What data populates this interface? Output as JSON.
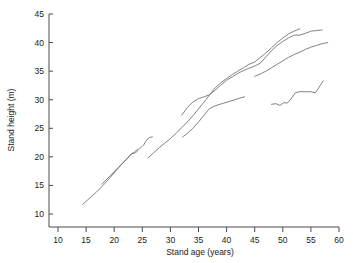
{
  "chart_data": {
    "type": "line",
    "title": "",
    "xlabel": "Stand age (years)",
    "ylabel": "Stand height (m)",
    "xlim": [
      7,
      60
    ],
    "ylim": [
      7.5,
      45
    ],
    "xticks": [
      10,
      15,
      20,
      25,
      30,
      35,
      40,
      45,
      50,
      55,
      60
    ],
    "yticks": [
      10,
      15,
      20,
      25,
      30,
      35,
      40,
      45
    ],
    "xtick_labels": [
      "10",
      "15",
      "20",
      "25",
      "30",
      "35",
      "40",
      "45",
      "50",
      "55",
      "60"
    ],
    "ytick_labels": [
      "10",
      "15",
      "20",
      "25",
      "30",
      "35",
      "40",
      "45"
    ],
    "grid": false,
    "legend": null,
    "line_color": "#6b6b6b",
    "axis_color": "#4a4a4a",
    "series": [
      {
        "name": "stand-1",
        "x": [
          14.4,
          15.2,
          16.0,
          16.8,
          17.6,
          18.4,
          19.2,
          20.0,
          20.8,
          21.6,
          22.4,
          23.0,
          23.6,
          24.2
        ],
        "y": [
          11.7,
          12.4,
          13.1,
          13.8,
          14.6,
          15.4,
          16.3,
          17.2,
          18.1,
          19.0,
          19.8,
          20.5,
          20.8,
          21.4
        ]
      },
      {
        "name": "stand-2",
        "x": [
          17.8,
          18.6,
          19.4,
          20.2,
          21.0,
          21.8,
          22.6,
          23.2,
          23.8,
          24.4,
          25.0
        ],
        "y": [
          15.2,
          16.0,
          16.8,
          17.6,
          18.4,
          19.2,
          20.0,
          20.6,
          20.7,
          21.3,
          21.9
        ]
      },
      {
        "name": "stand-3",
        "x": [
          25.2,
          25.8,
          26.3,
          26.8
        ],
        "y": [
          22.0,
          23.0,
          23.4,
          23.5
        ]
      },
      {
        "name": "stand-4",
        "x": [
          26.0,
          27.0,
          28.0,
          29.0,
          30.0,
          31.0,
          32.0,
          33.0,
          34.0,
          35.0,
          36.0,
          37.0,
          38.0,
          39.0,
          40.0,
          41.0,
          42.0,
          43.0,
          44.0,
          45.0,
          46.0,
          47.0,
          48.0,
          49.0,
          50.0,
          51.0,
          52.0,
          53.0
        ],
        "y": [
          19.8,
          20.7,
          21.6,
          22.4,
          23.2,
          24.1,
          25.1,
          26.1,
          27.2,
          28.4,
          29.6,
          30.9,
          32.1,
          33.0,
          33.7,
          34.4,
          35.0,
          35.6,
          36.2,
          36.6,
          37.4,
          38.2,
          39.1,
          40.0,
          40.8,
          41.5,
          42.0,
          42.4
        ]
      },
      {
        "name": "stand-5",
        "x": [
          32.0,
          33.0,
          34.0,
          35.0,
          36.0,
          37.0,
          38.0,
          39.0,
          40.0,
          41.0,
          42.0,
          43.0,
          44.0,
          45.0,
          46.0,
          47.0,
          48.0,
          49.0,
          50.0,
          51.0,
          52.0,
          53.0,
          54.0,
          55.0,
          56.0,
          57.0
        ],
        "y": [
          27.3,
          28.6,
          29.6,
          30.2,
          30.5,
          30.9,
          31.7,
          32.6,
          33.4,
          34.0,
          34.6,
          35.1,
          35.5,
          35.9,
          36.4,
          37.5,
          38.6,
          39.5,
          40.2,
          40.8,
          41.3,
          41.3,
          41.6,
          42.0,
          42.1,
          42.2
        ]
      },
      {
        "name": "stand-6",
        "x": [
          32.2,
          33.0,
          34.0,
          35.0,
          36.0,
          36.8,
          37.6,
          38.5,
          39.5,
          40.5,
          41.5,
          42.4,
          43.2
        ],
        "y": [
          23.5,
          24.1,
          25.0,
          26.1,
          27.3,
          28.3,
          28.8,
          29.1,
          29.4,
          29.7,
          30.0,
          30.3,
          30.5
        ]
      },
      {
        "name": "stand-7",
        "x": [
          45.0,
          46.0,
          47.0,
          48.0,
          49.0,
          50.0,
          51.0,
          52.0,
          53.0,
          54.0,
          55.0,
          56.0,
          57.0,
          58.0
        ],
        "y": [
          34.1,
          34.5,
          35.0,
          35.6,
          36.2,
          36.8,
          37.4,
          37.9,
          38.3,
          38.8,
          39.2,
          39.5,
          39.8,
          40.0
        ]
      },
      {
        "name": "stand-8",
        "x": [
          48.0,
          48.8,
          49.5,
          50.2,
          50.8,
          51.5,
          52.2,
          53.0,
          54.0,
          55.0,
          55.8,
          56.4,
          57.2
        ],
        "y": [
          29.2,
          29.3,
          29.0,
          29.5,
          29.4,
          30.2,
          31.2,
          31.4,
          31.4,
          31.4,
          31.2,
          32.1,
          33.3
        ]
      }
    ]
  }
}
